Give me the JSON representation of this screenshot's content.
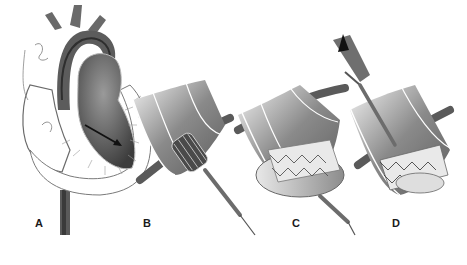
{
  "figure": {
    "panels": [
      {
        "label": "A",
        "depicts": "heart cross-section with catheter path through aorta into left ventricle"
      },
      {
        "label": "B",
        "depicts": "crimped valve stent on catheter positioned in aortic root"
      },
      {
        "label": "C",
        "depicts": "balloon expansion of valve stent"
      },
      {
        "label": "D",
        "depicts": "deployed valve stent with catheter withdrawal"
      }
    ]
  }
}
